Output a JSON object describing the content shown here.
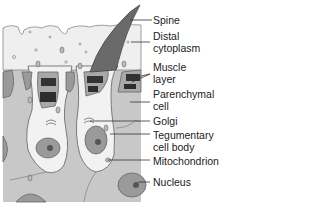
{
  "figure": {
    "labels": [
      {
        "id": "spine",
        "text": "Spine"
      },
      {
        "id": "distal-cytoplasm",
        "text": "Distal cytoplasm",
        "lines": [
          "Distal",
          "cytoplasm"
        ]
      },
      {
        "id": "muscle-layer",
        "text": "Muscle layer",
        "lines": [
          "Muscle",
          "layer"
        ]
      },
      {
        "id": "parenchymal-cell",
        "text": "Parenchymal cell",
        "lines": [
          "Parenchymal",
          "cell"
        ]
      },
      {
        "id": "golgi",
        "text": "Golgi"
      },
      {
        "id": "tegumentary-cell-body",
        "text": "Tegumentary cell body",
        "lines": [
          "Tegumentary",
          "cell body"
        ]
      },
      {
        "id": "mitochondrion",
        "text": "Mitochondrion"
      },
      {
        "id": "nucleus",
        "text": "Nucleus"
      }
    ],
    "colors": {
      "background_tissue": "#c9c9c9",
      "cytoplasm": "#f2f2f2",
      "spine": "#6a6a6a",
      "muscle": "#3a3a3a",
      "membrane": "#8a8a8a",
      "nucleus": "#9a9a9a",
      "leader_line": "#333333"
    }
  }
}
